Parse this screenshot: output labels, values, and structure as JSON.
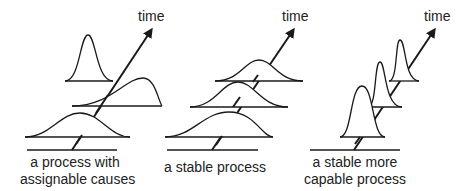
{
  "panels": [
    {
      "id": "assignable",
      "caption_line1": "a process with",
      "caption_line2": "assignable causes",
      "axis_label": "time"
    },
    {
      "id": "stable",
      "caption_line1": "a stable process",
      "caption_line2": "",
      "axis_label": "time"
    },
    {
      "id": "capable",
      "caption_line1": "a stable more",
      "caption_line2": "capable process",
      "axis_label": "time"
    }
  ],
  "colors": {
    "line": "#1a1a1a",
    "text": "#222222",
    "background": "#ffffff"
  }
}
